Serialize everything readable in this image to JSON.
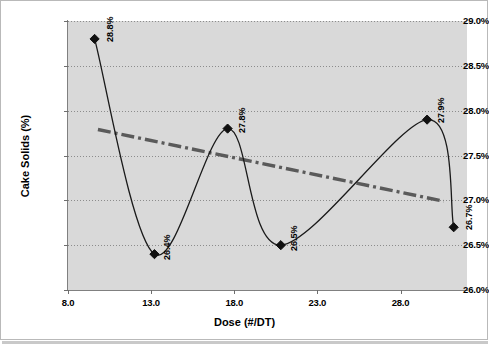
{
  "chart_data": {
    "type": "line",
    "title": "",
    "xlabel": "Dose (#/DT)",
    "ylabel": "Cake Solids (%)",
    "xlim": [
      8.0,
      32.0
    ],
    "ylim": [
      26.0,
      29.0
    ],
    "grid": true,
    "legend": "none",
    "x_ticks": [
      "8.0",
      "13.0",
      "18.0",
      "23.0",
      "28.0"
    ],
    "x_tick_values": [
      8.0,
      13.0,
      18.0,
      23.0,
      28.0
    ],
    "y_ticks": [
      "26.0%",
      "26.5%",
      "27.0%",
      "27.5%",
      "28.0%",
      "28.5%",
      "29.0%"
    ],
    "y_tick_values": [
      26.0,
      26.5,
      27.0,
      27.5,
      28.0,
      28.5,
      29.0
    ],
    "series": [
      {
        "name": "Cake Solids",
        "style": "smooth-line-with-diamond-markers",
        "color": "#1a1a1a",
        "x": [
          9.6,
          13.2,
          17.6,
          20.8,
          29.6,
          31.2
        ],
        "y": [
          28.8,
          26.4,
          27.8,
          26.5,
          27.9,
          26.7
        ],
        "point_labels": [
          "28.8%",
          "26.4%",
          "27.8%",
          "26.5%",
          "27.9%",
          "26.7%"
        ]
      },
      {
        "name": "Trendline",
        "style": "dash-dot",
        "color": "#5a5a5a",
        "x": [
          9.8,
          30.6
        ],
        "y": [
          27.79,
          26.99
        ]
      }
    ]
  },
  "axes": {
    "x_title": "Dose (#/DT)",
    "y_title": "Cake Solids (%)"
  }
}
